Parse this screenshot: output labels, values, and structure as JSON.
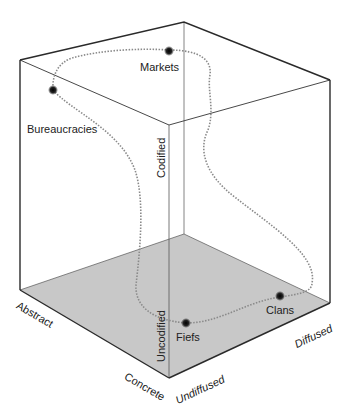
{
  "diagram": {
    "colors": {
      "edge": "#2a2a2a",
      "thin_edge": "#555555",
      "floor": "#c8c8c8",
      "path": "#8a8a8a",
      "node": "#1a1a1a",
      "text": "#222222"
    },
    "nodes": [
      {
        "id": "markets",
        "label": "Markets"
      },
      {
        "id": "bureaucracies",
        "label": "Bureaucracies"
      },
      {
        "id": "fiefs",
        "label": "Fiefs"
      },
      {
        "id": "clans",
        "label": "Clans"
      }
    ],
    "axes": {
      "codification": {
        "high": "Codified",
        "low": "Uncodified"
      },
      "abstraction": {
        "high": "Abstract",
        "low": "Concrete"
      },
      "diffusion": {
        "low": "Undiffused",
        "high": "Diffused"
      }
    }
  }
}
